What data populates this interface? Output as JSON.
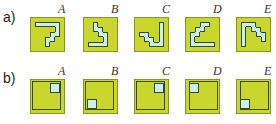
{
  "rows": [
    {
      "label": "a)",
      "options": [
        {
          "letter": "A",
          "cells": [
            [
              1,
              1
            ],
            [
              2,
              1
            ],
            [
              3,
              1
            ],
            [
              4,
              1
            ],
            [
              5,
              1
            ],
            [
              5,
              2
            ],
            [
              4,
              3
            ],
            [
              5,
              3
            ],
            [
              3,
              4
            ],
            [
              4,
              4
            ],
            [
              3,
              5
            ]
          ]
        },
        {
          "letter": "B",
          "cells": [
            [
              2,
              1
            ],
            [
              2,
              2
            ],
            [
              3,
              2
            ],
            [
              3,
              3
            ],
            [
              4,
              3
            ],
            [
              4,
              4
            ],
            [
              4,
              5
            ],
            [
              1,
              5
            ],
            [
              2,
              5
            ],
            [
              3,
              5
            ]
          ]
        },
        {
          "letter": "C",
          "cells": [
            [
              5,
              1
            ],
            [
              5,
              2
            ],
            [
              5,
              3
            ],
            [
              5,
              4
            ],
            [
              5,
              5
            ],
            [
              1,
              3
            ],
            [
              2,
              3
            ],
            [
              2,
              4
            ],
            [
              3,
              4
            ],
            [
              3,
              5
            ],
            [
              4,
              5
            ]
          ]
        },
        {
          "letter": "D",
          "cells": [
            [
              3,
              1
            ],
            [
              4,
              1
            ],
            [
              2,
              2
            ],
            [
              3,
              2
            ],
            [
              1,
              3
            ],
            [
              2,
              3
            ],
            [
              1,
              4
            ],
            [
              1,
              5
            ],
            [
              2,
              5
            ],
            [
              3,
              5
            ],
            [
              4,
              5
            ],
            [
              5,
              5
            ]
          ]
        },
        {
          "letter": "E",
          "cells": [
            [
              1,
              1
            ],
            [
              2,
              1
            ],
            [
              3,
              1
            ],
            [
              1,
              2
            ],
            [
              3,
              2
            ],
            [
              4,
              2
            ],
            [
              1,
              3
            ],
            [
              4,
              3
            ],
            [
              5,
              3
            ],
            [
              1,
              4
            ],
            [
              5,
              4
            ],
            [
              1,
              5
            ]
          ]
        }
      ]
    },
    {
      "label": "b)",
      "options": [
        {
          "letter": "A",
          "inner": "top-left",
          "square": "top-right"
        },
        {
          "letter": "B",
          "inner": "top-left",
          "square": "bottom-left"
        },
        {
          "letter": "C",
          "inner": "top-left",
          "square": "top-right"
        },
        {
          "letter": "D",
          "inner": "top-right",
          "square": "top-left"
        },
        {
          "letter": "E",
          "inner": "top-right",
          "square": "bottom-left"
        }
      ]
    }
  ],
  "colors": {
    "box_fill": "#c8d62e",
    "box_border": "#8a9420",
    "shape_fill": "#c9eef6",
    "outline": "#3a4a10"
  }
}
